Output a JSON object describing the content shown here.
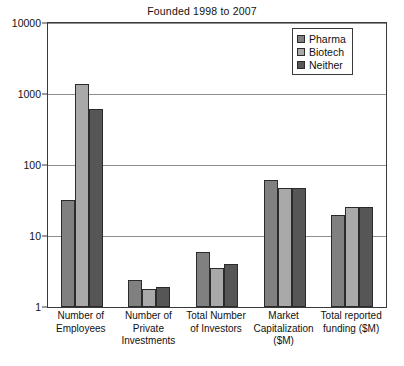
{
  "chart_data": {
    "type": "bar",
    "title": "Founded 1998 to 2007",
    "xlabel": "",
    "ylabel": "",
    "yscale": "log",
    "ylim": [
      1,
      10000
    ],
    "yticks": [
      1,
      10,
      100,
      1000,
      10000
    ],
    "ytick_labels": [
      "1",
      "10",
      "100",
      "1000",
      "10000"
    ],
    "grid": true,
    "legend_position": "top-right",
    "categories": [
      "Number of Employees",
      "Number of Private Investments",
      "Total Number of Investors",
      "Market Capitalization ($M)",
      "Total reported funding ($M)"
    ],
    "category_lines": [
      [
        "Number of",
        "Employees"
      ],
      [
        "Number of",
        "Private",
        "Investments"
      ],
      [
        "Total Number",
        "of Investors"
      ],
      [
        "Market",
        "Capitalization",
        "($M)"
      ],
      [
        "Total reported",
        "funding ($M)"
      ]
    ],
    "series": [
      {
        "name": "Pharma",
        "color": "#808080",
        "values": [
          32,
          2.4,
          6.0,
          62,
          20
        ]
      },
      {
        "name": "Biotech",
        "color": "#a9a9a9",
        "values": [
          1400,
          1.8,
          3.5,
          48,
          26
        ]
      },
      {
        "name": "Neither",
        "color": "#565656",
        "values": [
          620,
          1.9,
          4.0,
          47,
          26
        ]
      }
    ]
  },
  "legend": {
    "items": [
      {
        "label": "Pharma",
        "color": "#808080"
      },
      {
        "label": "Biotech",
        "color": "#a9a9a9"
      },
      {
        "label": "Neither",
        "color": "#565656"
      }
    ]
  },
  "colors": {
    "pharma": "#808080",
    "biotech": "#a9a9a9",
    "neither": "#565656",
    "axis": "#3a3a3a",
    "grid": "#8e8e8e",
    "background": "#ffffff",
    "text": "#111111"
  }
}
